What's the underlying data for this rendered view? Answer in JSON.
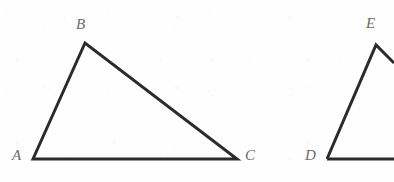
{
  "figure": {
    "kind": "geometry-diagram",
    "width": 394,
    "height": 182,
    "background_color": "#fefefe",
    "stroke_color": "#2b2b2b",
    "stroke_width": 3,
    "label_color": "#6b6b6b",
    "shapes": [
      {
        "name": "triangle-abc",
        "complete": true,
        "points": "33,159 85,43 237,159",
        "vertices": [
          {
            "id": "A",
            "label": "A",
            "x": 33,
            "y": 159,
            "label_x": 12,
            "label_y": 148
          },
          {
            "id": "B",
            "label": "B",
            "x": 85,
            "y": 43,
            "label_x": 76,
            "label_y": 17
          },
          {
            "id": "C",
            "label": "C",
            "x": 237,
            "y": 159,
            "label_x": 245,
            "label_y": 148
          }
        ]
      },
      {
        "name": "triangle-def",
        "complete": false,
        "path": "M 327,159 L 376,45 L 394,63 M 327,159 L 394,159",
        "vertices": [
          {
            "id": "D",
            "label": "D",
            "x": 327,
            "y": 159,
            "label_x": 305,
            "label_y": 148
          },
          {
            "id": "E",
            "label": "E",
            "x": 376,
            "y": 45,
            "label_x": 366,
            "label_y": 16
          }
        ]
      }
    ]
  }
}
